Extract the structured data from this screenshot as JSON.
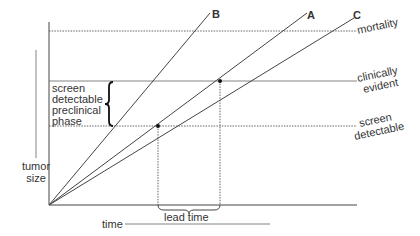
{
  "diagram": {
    "axes": {
      "y_label_line1": "tumor",
      "y_label_line2": "size",
      "x_label": "time"
    },
    "levels": {
      "mortality": "mortality",
      "clinical_line1": "clinically",
      "clinical_line2": "evident",
      "screen_line1": "screen",
      "screen_line2": "detectable"
    },
    "lines": {
      "a": "A",
      "b": "B",
      "c": "C"
    },
    "phase_label": {
      "line1": "screen",
      "line2": "detectable",
      "line3": "preclinical",
      "line4": "phase"
    },
    "lead_time": "lead time"
  }
}
